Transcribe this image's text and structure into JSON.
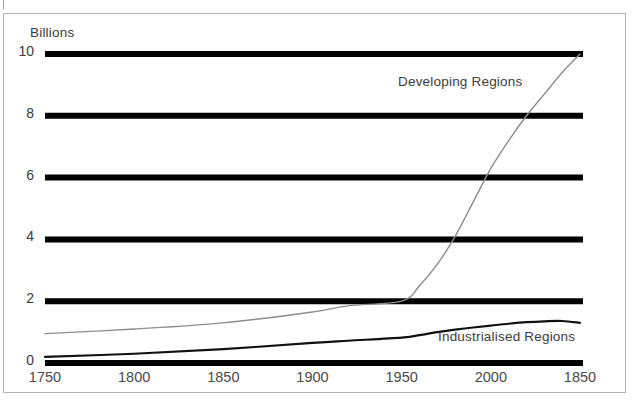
{
  "figure": {
    "axis_title": "Billions",
    "frame_color": "#b4b4b4",
    "background": "#ffffff"
  },
  "chart_data": {
    "type": "line",
    "title": "",
    "subtitle": "",
    "xlabel": "",
    "ylabel": "Billions",
    "xlim": [
      1750,
      2050
    ],
    "ylim": [
      0,
      10
    ],
    "grid": true,
    "grid_color": "#000000",
    "grid_orientation": "horizontal",
    "legend_position": "inline-annotations",
    "x_tick_labels": [
      "1750",
      "1800",
      "1850",
      "1900",
      "1950",
      "2000",
      "1850"
    ],
    "x_tick_values": [
      1750,
      1800,
      1850,
      1900,
      1950,
      2000,
      2050
    ],
    "y_tick_labels": [
      "0",
      "2",
      "4",
      "6",
      "8",
      "10"
    ],
    "y_tick_values": [
      0,
      2,
      4,
      6,
      8,
      10
    ],
    "x": [
      1750,
      1800,
      1850,
      1900,
      1920,
      1950,
      1960,
      1970,
      1980,
      1990,
      2000,
      2010,
      2020,
      2030,
      2040,
      2050
    ],
    "series": [
      {
        "name": "Developing Regions",
        "color": "#8c8c8c",
        "width": 1.4,
        "values": [
          0.95,
          1.1,
          1.3,
          1.65,
          1.85,
          2.0,
          2.5,
          3.2,
          4.1,
          5.2,
          6.3,
          7.2,
          8.0,
          8.7,
          9.4,
          10.0
        ]
      },
      {
        "name": "Industrialised Regions",
        "color": "#111111",
        "width": 2.2,
        "values": [
          0.2,
          0.3,
          0.45,
          0.65,
          0.72,
          0.82,
          0.9,
          1.0,
          1.08,
          1.15,
          1.21,
          1.27,
          1.32,
          1.35,
          1.36,
          1.3
        ]
      }
    ],
    "annotations": [
      {
        "text": "Developing Regions",
        "x": 1975,
        "y": 8.8
      },
      {
        "text": "Industrialised Regions",
        "x": 2000,
        "y": 0.75
      }
    ]
  }
}
